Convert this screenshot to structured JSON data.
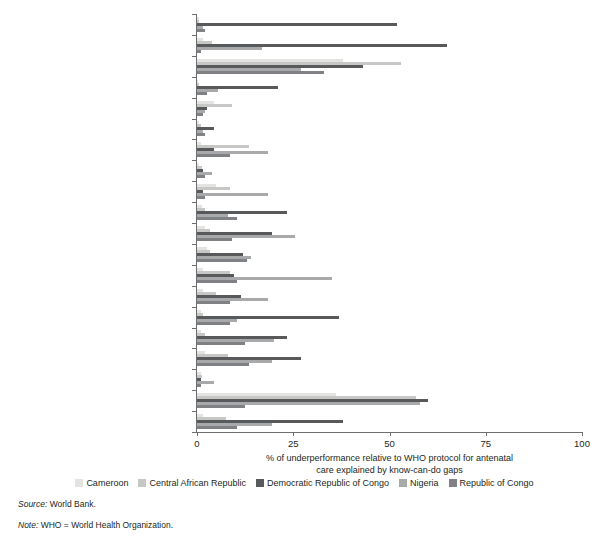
{
  "axis": {
    "x_ticks": [
      0,
      25,
      50,
      75,
      100
    ],
    "x_title_line1": "% of underperformance relative to WHO protocol for antenatal",
    "x_title_line2": "care explained by know-can-do gaps"
  },
  "legend": {
    "items": [
      {
        "label": "Cameroon",
        "color": "#e3e3e1"
      },
      {
        "label": "Central African Republic",
        "color": "#c7c8c6"
      },
      {
        "label": "Democratic Republic of Congo",
        "color": "#58595b"
      },
      {
        "label": "Nigeria",
        "color": "#a7a9ab"
      },
      {
        "label": "Republic of Congo",
        "color": "#808184"
      }
    ]
  },
  "notes": {
    "source_key": "Source:",
    "source_value": " World Bank.",
    "note_key": "Note:",
    "note_value": " WHO = World Health Organization."
  },
  "chart_data": {
    "type": "bar",
    "orientation": "horizontal",
    "title": "",
    "xlabel": "% of underperformance relative to WHO protocol for antenatal care explained by know-can-do gaps",
    "ylabel": "",
    "xlim": [
      0,
      100
    ],
    "grid": false,
    "legend_position": "bottom",
    "categories": [
      "Asked: HIV status",
      "Asked: blood group/rhesus",
      "Asked: current pregnancy danger signs",
      "Asked: previous tetanus vaccination",
      "Asked: last menstrual period",
      "Physical exam: weight",
      "Physical exam: blood pressure",
      "Physical exam: uterine height",
      "Physical exam: fetal heartbeat",
      "Physical exam: check for edema",
      "Test: HIV",
      "Test: syphilis",
      "Test: hemoglobin",
      "Test: urine",
      "Preventive: insecticide-treated bed net",
      "Preventive: iron/folic pills",
      "Preventive: antimalarials",
      "Preventive: tetanus toxoid injection",
      "Counseling: nutrition",
      "Counseling: danger signs"
    ],
    "category_prefixes": [
      "Asked:",
      "Asked:",
      "Asked:",
      "Asked:",
      "Asked:",
      "Physical exam:",
      "Physical exam:",
      "Physical exam:",
      "Physical exam:",
      "Physical exam:",
      "Test:",
      "Test:",
      "Test:",
      "Test:",
      "Preventive:",
      "Preventive:",
      "Preventive:",
      "Preventive:",
      "Counseling:",
      "Counseling:"
    ],
    "category_suffixes": [
      " HIV status",
      " blood group/rhesus",
      " current pregnancy danger signs",
      " previous tetanus vaccination",
      " last menstrual period",
      " weight",
      " blood pressure",
      " uterine height",
      " fetal heartbeat",
      " check for edema",
      " HIV",
      " syphilis",
      " hemoglobin",
      " urine",
      " insecticide-treated bed net",
      " iron/folic pills",
      " antimalarials",
      " tetanus toxoid injection",
      " nutrition",
      " danger signs"
    ],
    "series": [
      {
        "name": "Cameroon",
        "color": "#e3e3e1",
        "values": [
          0.5,
          1.5,
          38,
          0.3,
          4.5,
          0.4,
          1.0,
          0.6,
          5.0,
          1.2,
          2.0,
          2.5,
          1.5,
          1.5,
          1.0,
          1.0,
          2.0,
          1.0,
          36,
          1.5
        ]
      },
      {
        "name": "Central African Republic",
        "color": "#c7c8c6",
        "values": [
          0.6,
          4.0,
          53,
          0.4,
          9.0,
          1.0,
          13.5,
          1.2,
          8.5,
          2.0,
          3.5,
          3.5,
          8.5,
          5.0,
          1.5,
          2.0,
          8.0,
          1.3,
          57,
          7.5
        ]
      },
      {
        "name": "Democratic Republic of Congo",
        "color": "#58595b",
        "values": [
          52,
          65,
          43,
          21,
          2.5,
          4.5,
          4.5,
          1.5,
          1.5,
          23.5,
          19.5,
          12.0,
          9.5,
          11.5,
          37,
          23.5,
          27,
          1.0,
          60,
          38
        ]
      },
      {
        "name": "Nigeria",
        "color": "#a7a9ab",
        "values": [
          1.5,
          17,
          27,
          5.5,
          2.2,
          1.5,
          18.5,
          4.0,
          18.5,
          8.0,
          25.5,
          14.0,
          35,
          18.5,
          10.5,
          20,
          19.5,
          4.5,
          58,
          19.5
        ]
      },
      {
        "name": "Republic of Congo",
        "color": "#808184",
        "values": [
          2.0,
          1.0,
          33,
          2.5,
          1.5,
          2.0,
          8.5,
          2.0,
          2.0,
          10.5,
          9.0,
          13.0,
          10.5,
          8.5,
          8.5,
          12.5,
          13.5,
          1.0,
          12.5,
          10.5
        ]
      }
    ]
  }
}
